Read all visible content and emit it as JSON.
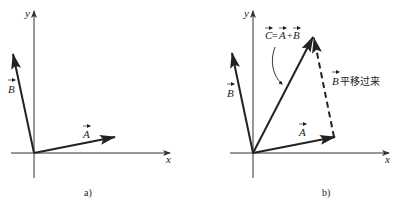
{
  "panels": [
    {
      "caption": "a)",
      "axes": {
        "x_label": "x",
        "y_label": "y"
      },
      "vectors": [
        {
          "name": "A",
          "label": "A"
        },
        {
          "name": "B",
          "label": "B"
        }
      ]
    },
    {
      "caption": "b)",
      "axes": {
        "x_label": "x",
        "y_label": "y"
      },
      "vectors": [
        {
          "name": "A",
          "label": "A"
        },
        {
          "name": "B",
          "label": "B"
        },
        {
          "name": "C",
          "label": "C"
        }
      ],
      "annotations": {
        "sum_eq_C": "C",
        "sum_eq_sign": "=",
        "sum_eq_A": "A",
        "sum_eq_plus": "+",
        "sum_eq_B": "B",
        "translated_B": "B",
        "translated_text": "平移过来"
      }
    }
  ]
}
